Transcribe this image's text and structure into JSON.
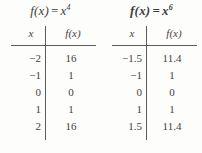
{
  "figure": {
    "background_color": "#fdfdfc",
    "text_color": "#3f3f3f",
    "rule_color": "#5c5c5c"
  },
  "tables": [
    {
      "id": "table-x4",
      "title_fn": "f(x)",
      "title_eq": "=",
      "title_base": "x",
      "title_exponent": "4",
      "title_bold": false,
      "headers": {
        "x": "x",
        "fx": "f(x)"
      },
      "rows": [
        {
          "x": "−2",
          "fx": "16"
        },
        {
          "x": "−1",
          "fx": "1"
        },
        {
          "x": "0",
          "fx": "0"
        },
        {
          "x": "1",
          "fx": "1"
        },
        {
          "x": "2",
          "fx": "16"
        }
      ]
    },
    {
      "id": "table-x6",
      "title_fn": "f(x)",
      "title_eq": "=",
      "title_base": "x",
      "title_exponent": "6",
      "title_bold": true,
      "headers": {
        "x": "x",
        "fx": "f(x)"
      },
      "rows": [
        {
          "x": "−1.5",
          "fx": "11.4"
        },
        {
          "x": "−1",
          "fx": "1"
        },
        {
          "x": "0",
          "fx": "0"
        },
        {
          "x": "1",
          "fx": "1"
        },
        {
          "x": "1.5",
          "fx": "11.4"
        }
      ]
    }
  ]
}
